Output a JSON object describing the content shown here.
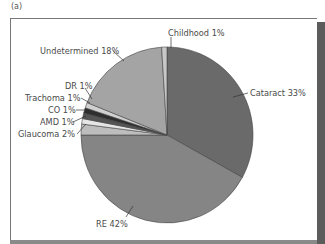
{
  "panel_label": "(a)",
  "chart_data": {
    "type": "pie",
    "title": "",
    "start_angle_deg": 0,
    "direction": "clockwise",
    "slices": [
      {
        "label": "Cataract",
        "value": 33,
        "text": "Cataract 33%",
        "color": "#6a6a6a"
      },
      {
        "label": "RE",
        "value": 42,
        "text": "RE 42%",
        "color": "#858585"
      },
      {
        "label": "Glaucoma",
        "value": 2,
        "text": "Glaucoma 2%",
        "color": "#bdbdbd"
      },
      {
        "label": "AMD",
        "value": 1,
        "text": "AMD 1%",
        "color": "#e6e6e6"
      },
      {
        "label": "CO",
        "value": 1,
        "text": "CO 1%",
        "color": "#555555"
      },
      {
        "label": "Trachoma",
        "value": 1,
        "text": "Trachoma 1%",
        "color": "#2e2e2e"
      },
      {
        "label": "DR",
        "value": 1,
        "text": "DR 1%",
        "color": "#d0d0d0"
      },
      {
        "label": "Undetermined",
        "value": 18,
        "text": "Undetermined 18%",
        "color": "#a4a4a4"
      },
      {
        "label": "Childhood",
        "value": 1,
        "text": "Childhood 1%",
        "color": "#c8c8c8"
      }
    ],
    "legend": "none (callout labels)"
  },
  "labels": {
    "cataract": "Cataract 33%",
    "re": "RE 42%",
    "glaucoma": "Glaucoma 2%",
    "amd": "AMD 1%",
    "co": "CO 1%",
    "trachoma": "Trachoma 1%",
    "dr": "DR 1%",
    "undetermined": "Undetermined 18%",
    "childhood": "Childhood 1%"
  }
}
